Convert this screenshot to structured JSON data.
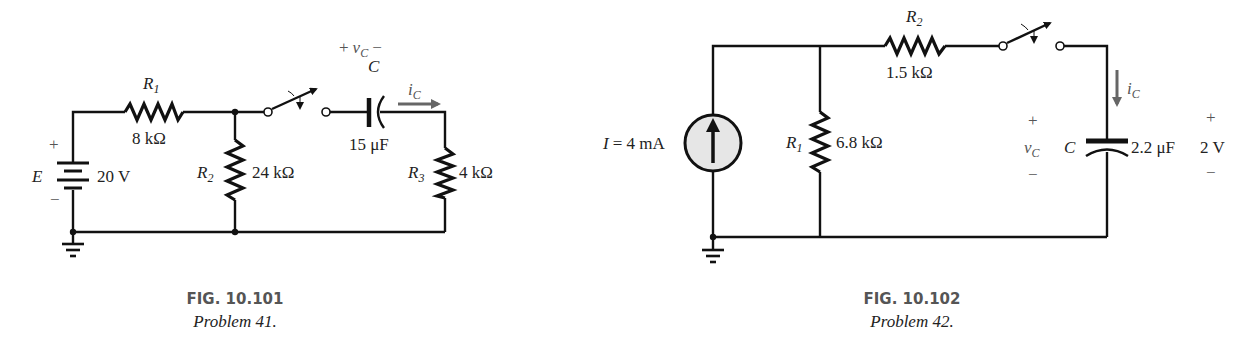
{
  "figures": [
    {
      "id": "fig-10-101",
      "caption": {
        "figure": "FIG. 10.101",
        "problem": "Problem 41."
      },
      "source": {
        "name": "E",
        "value": "20 V",
        "plus": "+",
        "minus": "−"
      },
      "resistors": [
        {
          "name": "R",
          "sub": "1",
          "value": "8 kΩ"
        },
        {
          "name": "R",
          "sub": "2",
          "value": "24 kΩ"
        },
        {
          "name": "R",
          "sub": "3",
          "value": "4 kΩ"
        }
      ],
      "capacitor": {
        "name": "C",
        "value": "15 μF",
        "voltage_label": {
          "plus": "+",
          "v": "v",
          "sub": "C",
          "minus": "−"
        }
      },
      "current_label": {
        "i": "i",
        "sub": "C"
      }
    },
    {
      "id": "fig-10-102",
      "caption": {
        "figure": "FIG. 10.102",
        "problem": "Problem 42."
      },
      "source": {
        "name": "I",
        "value": "= 4 mA"
      },
      "resistors": [
        {
          "name": "R",
          "sub": "1",
          "value": "6.8 kΩ"
        },
        {
          "name": "R",
          "sub": "2",
          "value": "1.5 kΩ"
        }
      ],
      "capacitor": {
        "name": "C",
        "value": "2.2 μF",
        "initial_voltage": "2 V",
        "plus": "+",
        "minus": "−",
        "voltage_label": {
          "v": "v",
          "sub": "C",
          "plus": "+",
          "minus": "−"
        }
      },
      "current_label": {
        "i": "i",
        "sub": "C"
      }
    }
  ]
}
